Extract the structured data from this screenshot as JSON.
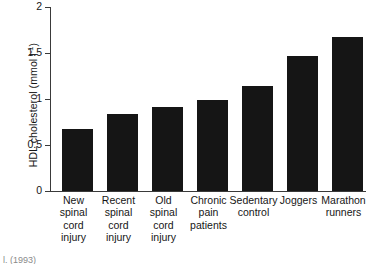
{
  "chart_data": {
    "type": "bar",
    "title": "",
    "xlabel": "",
    "ylabel": "HDL cholesterol (mmol l",
    "ylabel_superscript": "-1",
    "ylabel_suffix": ")",
    "ylim": [
      0,
      2
    ],
    "ytick_labels": [
      "2",
      "1.5",
      "1",
      "0.5",
      "0"
    ],
    "ytick_values": [
      2,
      1.5,
      1,
      0.5,
      0
    ],
    "grid": false,
    "legend": false,
    "bar_color": "#151515",
    "axis_color": "#3a3a3a",
    "categories": [
      "New spinal cord injury",
      "Recent spinal cord injury",
      "Old spinal cord injury",
      "Chronic pain patients",
      "Sedentary control",
      "Joggers",
      "Marathon runners"
    ],
    "category_lines": [
      [
        "New",
        "spinal",
        "cord",
        "injury"
      ],
      [
        "Recent",
        "spinal",
        "cord",
        "injury"
      ],
      [
        "Old",
        "spinal",
        "cord",
        "injury"
      ],
      [
        "Chronic",
        "pain",
        "patients"
      ],
      [
        "Sedentary",
        "control"
      ],
      [
        "Joggers"
      ],
      [
        "Marathon",
        "runners"
      ]
    ],
    "values": [
      0.67,
      0.84,
      0.91,
      0.99,
      1.14,
      1.47,
      1.67
    ]
  },
  "footer": {
    "note": "l. (1993)"
  }
}
